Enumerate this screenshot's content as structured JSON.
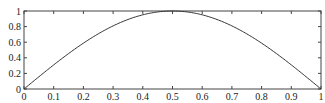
{
  "chart_data": {
    "type": "line",
    "title": "",
    "xlabel": "",
    "ylabel": "",
    "xlim": [
      0,
      1
    ],
    "ylim": [
      0,
      1
    ],
    "grid": false,
    "legend": null,
    "x_ticks": [
      "0",
      "0.1",
      "0.2",
      "0.3",
      "0.4",
      "0.5",
      "0.6",
      "0.7",
      "0.8",
      "0.9",
      "1"
    ],
    "y_ticks": [
      "0",
      "0.2",
      "0.4",
      "0.6",
      "0.8",
      "1"
    ],
    "series": [
      {
        "name": "sin(pi x)",
        "color": "#333333",
        "x": [
          0,
          0.05,
          0.1,
          0.15,
          0.2,
          0.25,
          0.3,
          0.35,
          0.4,
          0.45,
          0.5,
          0.55,
          0.6,
          0.65,
          0.7,
          0.75,
          0.8,
          0.85,
          0.9,
          0.95,
          1
        ],
        "y": [
          0,
          0.156,
          0.309,
          0.454,
          0.588,
          0.707,
          0.809,
          0.891,
          0.951,
          0.988,
          1,
          0.988,
          0.951,
          0.891,
          0.809,
          0.707,
          0.588,
          0.454,
          0.309,
          0.156,
          0
        ]
      }
    ]
  },
  "colors": {
    "axis": "#444444",
    "line": "#333333",
    "background": "#ffffff"
  }
}
